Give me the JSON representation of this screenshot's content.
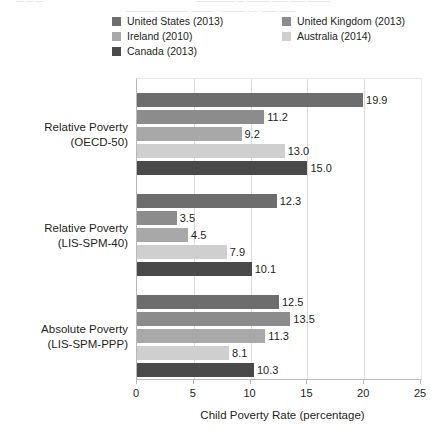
{
  "artifact": {
    "frag_a": "— — —",
    "frag_b": "—————  —  ——— ——  ——  ———",
    "frag_c": "·  ———— ———— ———   ·  ———  ·—  ·——  ——"
  },
  "legend": {
    "position": "top",
    "items": [
      {
        "label": "United States (2013)",
        "color": "#6d6d6d"
      },
      {
        "label": "Ireland (2010)",
        "color": "#a8a8a8"
      },
      {
        "label": "Canada (2013)",
        "color": "#4a4a4a"
      },
      {
        "label": "United Kingdom (2013)",
        "color": "#8c8c8c"
      },
      {
        "label": "Australia (2014)",
        "color": "#cfcfcf"
      }
    ]
  },
  "chart_data": {
    "type": "bar",
    "orientation": "horizontal",
    "title": "",
    "xlabel": "Child Poverty Rate (percentage)",
    "ylabel": "",
    "xlim": [
      0,
      25
    ],
    "xticks": [
      "0",
      "5",
      "10",
      "15",
      "20",
      "25"
    ],
    "grid": true,
    "legend_position": "top",
    "categories": [
      "Relative Poverty (OECD-50)",
      "Relative Poverty (LIS-SPM-40)",
      "Absolute Poverty (LIS-SPM-PPP)"
    ],
    "category_lines": [
      [
        "Relative Poverty",
        "(OECD-50)"
      ],
      [
        "Relative Poverty",
        "(LIS-SPM-40)"
      ],
      [
        "Absolute Poverty",
        "(LIS-SPM-PPP)"
      ]
    ],
    "series": [
      {
        "name": "United States (2013)",
        "color": "#6d6d6d",
        "values": [
          19.9,
          12.3,
          12.5
        ],
        "labels": [
          "19.9",
          "12.3",
          "12.5"
        ]
      },
      {
        "name": "United Kingdom (2013)",
        "color": "#8c8c8c",
        "values": [
          11.2,
          3.5,
          13.5
        ],
        "labels": [
          "11.2",
          "3.5",
          "13.5"
        ]
      },
      {
        "name": "Ireland (2010)",
        "color": "#a8a8a8",
        "values": [
          9.2,
          4.5,
          11.3
        ],
        "labels": [
          "9.2",
          "4.5",
          "11.3"
        ]
      },
      {
        "name": "Australia (2014)",
        "color": "#cfcfcf",
        "values": [
          13.0,
          7.9,
          8.1
        ],
        "labels": [
          "13.0",
          "7.9",
          "8.1"
        ]
      },
      {
        "name": "Canada (2013)",
        "color": "#4a4a4a",
        "values": [
          15.0,
          10.1,
          10.3
        ],
        "labels": [
          "15.0",
          "10.1",
          "10.3"
        ]
      }
    ]
  }
}
